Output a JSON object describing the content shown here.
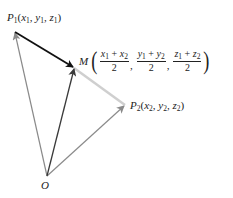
{
  "points": {
    "P1": {
      "name": "P",
      "sub": "1",
      "coords": [
        "x",
        "1",
        "y",
        "1",
        "z",
        "1"
      ],
      "x": 15,
      "y": 32
    },
    "M": {
      "name": "M",
      "x": 74,
      "y": 68
    },
    "P2": {
      "name": "P",
      "sub": "2",
      "coords": [
        "x",
        "2",
        "y",
        "2",
        "z",
        "2"
      ],
      "x": 125,
      "y": 106
    },
    "O": {
      "name": "O",
      "x": 47,
      "y": 176
    }
  },
  "labels": {
    "p1": {
      "letter": "P",
      "sub": "1",
      "open": "(",
      "x": "x",
      "xs": "1",
      "y": "y",
      "ys": "1",
      "z": "z",
      "zs": "1",
      "close": ")",
      "comma": ", "
    },
    "p2": {
      "letter": "P",
      "sub": "2",
      "open": "(",
      "x": "x",
      "xs": "2",
      "y": "y",
      "ys": "2",
      "z": "z",
      "zs": "2",
      "close": ")",
      "comma": ", "
    },
    "m": {
      "letter": "M",
      "open": "(",
      "close": ")",
      "comma": ",",
      "plus": " + ",
      "den": "2",
      "f1": {
        "a": "x",
        "as": "1",
        "b": "x",
        "bs": "2"
      },
      "f2": {
        "a": "y",
        "as": "1",
        "b": "y",
        "bs": "2"
      },
      "f3": {
        "a": "z",
        "as": "1",
        "b": "z",
        "bs": "2"
      }
    },
    "o": {
      "letter": "O"
    }
  },
  "colors": {
    "op1": "#8a8a8a",
    "op2": "#8a8a8a",
    "om": "#3a3a3a",
    "p1m": "#111111",
    "mp2": "#cfcfcf"
  }
}
